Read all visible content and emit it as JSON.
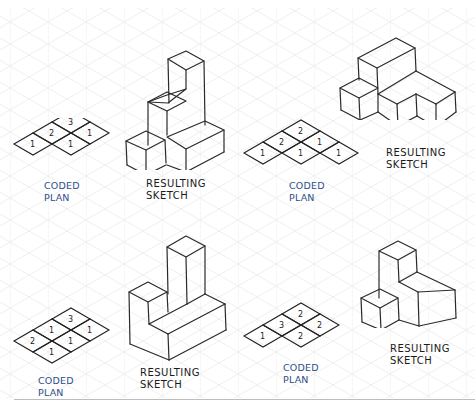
{
  "figure": {
    "background": "#ffffff",
    "grid": {
      "type": "isometric",
      "color": "#e6e6e6"
    },
    "plan_label_color": "#2f4f8a",
    "sketch_stroke_color": "#2a2a2a"
  },
  "examples": [
    {
      "id": "top-left",
      "plan": {
        "label_line1": "CODED",
        "label_line2": "PLAN",
        "cells": [
          {
            "row": 0,
            "col": 0,
            "value": "1"
          },
          {
            "row": 1,
            "col": 0,
            "value": "2"
          },
          {
            "row": 2,
            "col": 0,
            "value": "3"
          },
          {
            "row": 1,
            "col": 1,
            "value": "1"
          },
          {
            "row": 2,
            "col": 1,
            "value": "1"
          }
        ],
        "values_text": [
          "1",
          "2",
          "3",
          "1",
          "1"
        ]
      },
      "sketch": {
        "label_line1": "RESULTING",
        "label_line2": "SKETCH"
      }
    },
    {
      "id": "top-right",
      "plan": {
        "label_line1": "CODED",
        "label_line2": "PLAN",
        "values_text": [
          "1",
          "2",
          "2",
          "1",
          "1",
          "1"
        ]
      },
      "sketch": {
        "label_line1": "RESULTING",
        "label_line2": "SKETCH"
      }
    },
    {
      "id": "bottom-left",
      "plan": {
        "label_line1": "CODED",
        "label_line2": "PLAN",
        "values_text": [
          "2",
          "1",
          "3",
          "1",
          "1",
          "1"
        ]
      },
      "sketch": {
        "label_line1": "RESULTING",
        "label_line2": "SKETCH"
      }
    },
    {
      "id": "bottom-right",
      "plan": {
        "label_line1": "CODED",
        "label_line2": "PLAN",
        "values_text": [
          "1",
          "3",
          "2",
          "2",
          "2"
        ]
      },
      "sketch": {
        "label_line1": "RESULTING",
        "label_line2": "SKETCH"
      }
    }
  ]
}
